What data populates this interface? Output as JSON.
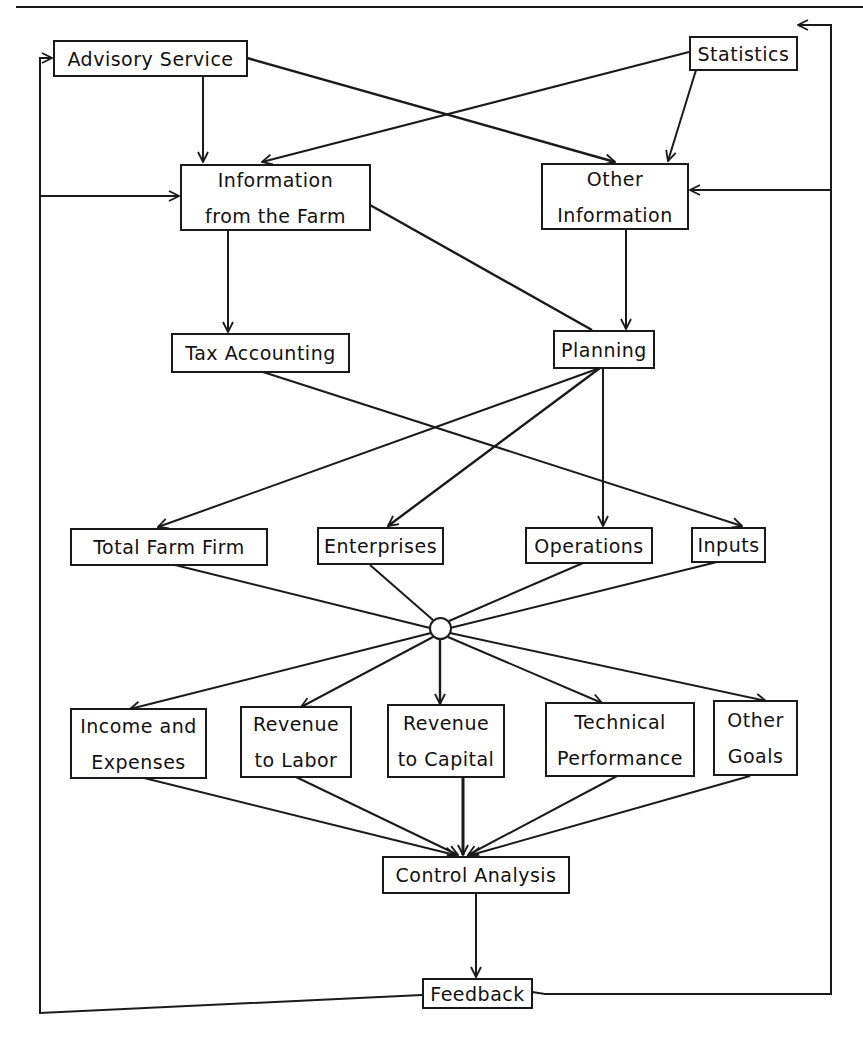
{
  "diagram": {
    "type": "flowchart",
    "title": "",
    "colors": {
      "ink": "#1a1a1a",
      "background": "#ffffff"
    },
    "nodes": {
      "advisory_service": {
        "lines": [
          "Advisory Service"
        ]
      },
      "statistics": {
        "lines": [
          "Statistics"
        ]
      },
      "information_from_farm": {
        "lines": [
          "Information",
          "from the Farm"
        ]
      },
      "other_information": {
        "lines": [
          "Other",
          "Information"
        ]
      },
      "tax_accounting": {
        "lines": [
          "Tax Accounting"
        ]
      },
      "planning": {
        "lines": [
          "Planning"
        ]
      },
      "total_farm_firm": {
        "lines": [
          "Total Farm Firm"
        ]
      },
      "enterprises": {
        "lines": [
          "Enterprises"
        ]
      },
      "operations": {
        "lines": [
          "Operations"
        ]
      },
      "inputs": {
        "lines": [
          "Inputs"
        ]
      },
      "income_and_expenses": {
        "lines": [
          "Income and",
          "Expenses"
        ]
      },
      "revenue_to_labor": {
        "lines": [
          "Revenue",
          "to Labor"
        ]
      },
      "revenue_to_capital": {
        "lines": [
          "Revenue",
          "to Capital"
        ]
      },
      "technical_performance": {
        "lines": [
          "Technical",
          "Performance"
        ]
      },
      "other_goals": {
        "lines": [
          "Other",
          "Goals"
        ]
      },
      "control_analysis": {
        "lines": [
          "Control Analysis"
        ]
      },
      "feedback": {
        "lines": [
          "Feedback"
        ]
      }
    },
    "edges": [
      {
        "from": "Advisory Service",
        "to": "Information from the Farm"
      },
      {
        "from": "Advisory Service",
        "to": "Other Information"
      },
      {
        "from": "Statistics",
        "to": "Information from the Farm"
      },
      {
        "from": "Statistics",
        "to": "Other Information"
      },
      {
        "from": "Information from the Farm",
        "to": "Tax Accounting"
      },
      {
        "from": "Information from the Farm",
        "to": "Planning"
      },
      {
        "from": "Other Information",
        "to": "Planning"
      },
      {
        "from": "Tax Accounting",
        "to": "Inputs"
      },
      {
        "from": "Planning",
        "to": "Total Farm Firm"
      },
      {
        "from": "Planning",
        "to": "Enterprises"
      },
      {
        "from": "Planning",
        "to": "Operations"
      },
      {
        "from": "Total Farm Firm",
        "to": "hub"
      },
      {
        "from": "Enterprises",
        "to": "hub"
      },
      {
        "from": "Operations",
        "to": "hub"
      },
      {
        "from": "Inputs",
        "to": "hub"
      },
      {
        "from": "hub",
        "to": "Income and Expenses"
      },
      {
        "from": "hub",
        "to": "Revenue to Labor"
      },
      {
        "from": "hub",
        "to": "Revenue to Capital"
      },
      {
        "from": "hub",
        "to": "Technical Performance"
      },
      {
        "from": "hub",
        "to": "Other Goals"
      },
      {
        "from": "Income and Expenses",
        "to": "Control Analysis"
      },
      {
        "from": "Revenue to Labor",
        "to": "Control Analysis"
      },
      {
        "from": "Revenue to Capital",
        "to": "Control Analysis"
      },
      {
        "from": "Technical Performance",
        "to": "Control Analysis"
      },
      {
        "from": "Other Goals",
        "to": "Control Analysis"
      },
      {
        "from": "Control Analysis",
        "to": "Feedback"
      },
      {
        "from": "Feedback",
        "to": "Advisory Service"
      },
      {
        "from": "Feedback",
        "to": "Information from the Farm"
      },
      {
        "from": "Feedback",
        "to": "Statistics"
      },
      {
        "from": "Feedback",
        "to": "Other Information"
      }
    ]
  }
}
